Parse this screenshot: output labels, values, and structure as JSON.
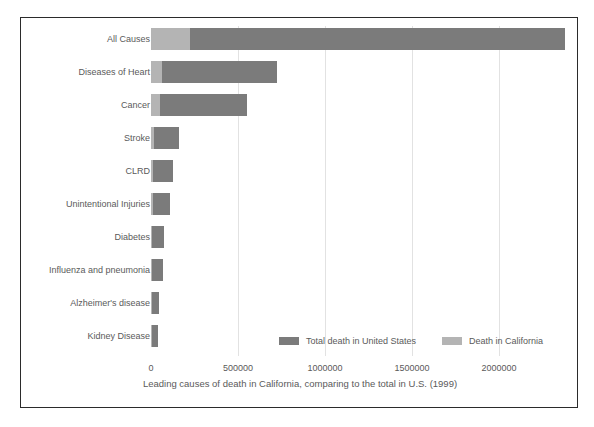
{
  "chart_data": {
    "type": "bar",
    "orientation": "horizontal",
    "stacked": true,
    "title": "",
    "xlabel": "Leading causes of death in California, comparing to the total in U.S. (1999)",
    "ylabel": "",
    "categories": [
      "All Causes",
      "Diseases of Heart",
      "Cancer",
      "Stroke",
      "CLRD",
      "Unintentional Injuries",
      "Diabetes",
      "Influenza and pneumonia",
      "Alzheimer's disease",
      "Kidney Disease"
    ],
    "series": [
      {
        "name": "Death in California",
        "color": "#b4b4b4",
        "values": [
          224000,
          62000,
          54000,
          18000,
          13000,
          10000,
          6000,
          6000,
          4000,
          3000
        ]
      },
      {
        "name": "Total death in United States",
        "color": "#7b7b7b",
        "values": [
          2154000,
          663000,
          495000,
          143000,
          112000,
          98000,
          68000,
          63000,
          44000,
          35000
        ]
      }
    ],
    "xlim": [
      0,
      2400000
    ],
    "xticks": [
      0,
      500000,
      1000000,
      1500000,
      2000000
    ],
    "xtick_labels": [
      "0",
      "500000",
      "1000000",
      "1500000",
      "2000000"
    ],
    "grid": "vertical",
    "legend_position": "bottom-center",
    "legend": [
      {
        "label": "Total death in United States",
        "color": "#7b7b7b"
      },
      {
        "label": "Death in California",
        "color": "#b4b4b4"
      }
    ]
  }
}
